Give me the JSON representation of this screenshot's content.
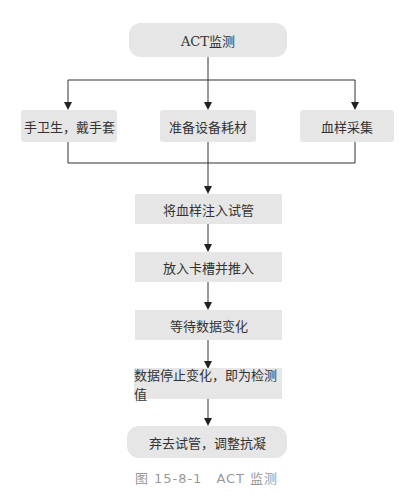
{
  "flowchart": {
    "start": "ACT监测",
    "branches": [
      "手卫生，戴手套",
      "准备设备耗材",
      "血样采集"
    ],
    "steps": [
      "将血样注入试管",
      "放入卡槽并推入",
      "等待数据变化",
      "数据停止变化，即为检测值"
    ],
    "end": "弃去试管，调整抗凝"
  },
  "caption": "图 15-8-1　ACT 监测"
}
